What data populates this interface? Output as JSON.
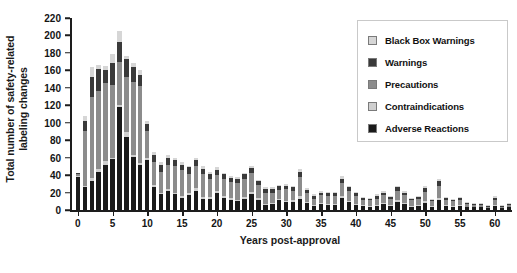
{
  "chart_data": {
    "type": "bar",
    "subtype": "stacked-bar",
    "title": "",
    "xlabel": "Years post-approval",
    "ylabel": "Total number of safety-related labeling changes",
    "xlim": [
      -0.8,
      62.5
    ],
    "ylim": [
      0,
      220
    ],
    "ytick_step": 20,
    "grid": false,
    "legend_position": "top-right",
    "yticks": [
      0,
      20,
      40,
      60,
      80,
      100,
      120,
      140,
      160,
      180,
      200,
      220
    ],
    "ytick_labels": [
      "0",
      "20",
      "40",
      "60",
      "80",
      "100",
      "120",
      "140",
      "160",
      "180",
      "200",
      "220"
    ],
    "xticks": [
      0,
      5,
      10,
      15,
      20,
      25,
      30,
      35,
      40,
      45,
      50,
      55,
      60
    ],
    "xtick_labels": [
      "0",
      "5",
      "10",
      "15",
      "20",
      "25",
      "30",
      "35",
      "40",
      "45",
      "50",
      "55",
      "60"
    ],
    "colors": {
      "black_box_warnings": "#d6d6d6",
      "warnings": "#3a3a3a",
      "precautions": "#8c8c8c",
      "contraindications": "#cfcfcf",
      "adverse_reactions": "#1a1a1a"
    },
    "series": [
      {
        "name": "Adverse Reactions",
        "color": "#1a1a1a",
        "values": [
          38,
          26,
          33,
          43,
          52,
          58,
          118,
          84,
          61,
          52,
          57,
          26,
          18,
          22,
          18,
          14,
          17,
          22,
          13,
          13,
          20,
          14,
          12,
          10,
          13,
          18,
          12,
          6,
          7,
          11,
          9,
          9,
          13,
          8,
          5,
          7,
          6,
          6,
          14,
          9,
          6,
          5,
          4,
          5,
          7,
          5,
          9,
          7,
          4,
          5,
          8,
          4,
          12,
          5,
          4,
          5,
          3,
          3,
          3,
          2,
          5,
          2,
          3
        ]
      },
      {
        "name": "Contraindications",
        "color": "#cfcfcf",
        "values": [
          1,
          1,
          4,
          4,
          4,
          2,
          2,
          5,
          2,
          2,
          3,
          3,
          2,
          2,
          2,
          2,
          2,
          3,
          2,
          2,
          2,
          2,
          2,
          1,
          2,
          3,
          2,
          1,
          1,
          2,
          1,
          2,
          3,
          1,
          1,
          1,
          1,
          1,
          2,
          1,
          1,
          1,
          1,
          1,
          1,
          1,
          2,
          1,
          1,
          1,
          2,
          1,
          2,
          1,
          1,
          1,
          0,
          0,
          0,
          0,
          1,
          0,
          0
        ]
      },
      {
        "name": "Precautions",
        "color": "#8c8c8c",
        "values": [
          2,
          64,
          93,
          89,
          89,
          83,
          50,
          64,
          84,
          88,
          30,
          26,
          24,
          28,
          30,
          30,
          22,
          25,
          26,
          21,
          18,
          20,
          18,
          20,
          21,
          21,
          15,
          13,
          12,
          10,
          14,
          11,
          22,
          10,
          7,
          9,
          9,
          9,
          15,
          12,
          9,
          6,
          6,
          7,
          9,
          7,
          11,
          9,
          6,
          7,
          11,
          5,
          14,
          6,
          5,
          6,
          4,
          3,
          3,
          2,
          6,
          2,
          3
        ]
      },
      {
        "name": "Warnings",
        "color": "#3a3a3a",
        "values": [
          1,
          11,
          23,
          26,
          16,
          25,
          22,
          20,
          17,
          13,
          9,
          8,
          8,
          8,
          7,
          6,
          8,
          7,
          6,
          5,
          6,
          5,
          5,
          5,
          5,
          6,
          4,
          4,
          4,
          4,
          4,
          4,
          6,
          4,
          3,
          3,
          3,
          3,
          5,
          4,
          3,
          2,
          2,
          3,
          3,
          2,
          4,
          3,
          2,
          2,
          4,
          2,
          5,
          2,
          2,
          2,
          1,
          1,
          1,
          1,
          2,
          1,
          1
        ]
      },
      {
        "name": "Black Box Warnings",
        "color": "#d6d6d6",
        "values": [
          0,
          6,
          11,
          4,
          4,
          11,
          13,
          4,
          4,
          5,
          3,
          3,
          3,
          3,
          3,
          3,
          2,
          3,
          3,
          3,
          3,
          2,
          2,
          2,
          2,
          3,
          2,
          2,
          2,
          2,
          2,
          2,
          3,
          2,
          2,
          2,
          2,
          2,
          3,
          2,
          2,
          1,
          1,
          2,
          2,
          1,
          2,
          2,
          1,
          1,
          2,
          1,
          3,
          1,
          1,
          1,
          1,
          1,
          1,
          1,
          2,
          1,
          1
        ]
      }
    ],
    "x": [
      0,
      1,
      2,
      3,
      4,
      5,
      6,
      7,
      8,
      9,
      10,
      11,
      12,
      13,
      14,
      15,
      16,
      17,
      18,
      19,
      20,
      21,
      22,
      23,
      24,
      25,
      26,
      27,
      28,
      29,
      30,
      31,
      32,
      33,
      34,
      35,
      36,
      37,
      38,
      39,
      40,
      41,
      42,
      43,
      44,
      45,
      46,
      47,
      48,
      49,
      50,
      51,
      52,
      53,
      54,
      55,
      56,
      57,
      58,
      59,
      60,
      61,
      62
    ],
    "totals": [
      42,
      108,
      164,
      166,
      165,
      179,
      205,
      177,
      168,
      160,
      102,
      66,
      55,
      63,
      60,
      55,
      51,
      60,
      50,
      44,
      49,
      43,
      39,
      38,
      43,
      51,
      35,
      26,
      26,
      29,
      30,
      28,
      47,
      25,
      18,
      22,
      21,
      21,
      39,
      28,
      21,
      15,
      14,
      18,
      22,
      16,
      28,
      22,
      14,
      16,
      27,
      13,
      36,
      15,
      13,
      15,
      9,
      8,
      8,
      6,
      16,
      6,
      8
    ]
  },
  "legend": {
    "items": [
      {
        "label": "Black Box Warnings",
        "color": "#d6d6d6",
        "name": "black-box-warnings"
      },
      {
        "label": "Warnings",
        "color": "#3a3a3a",
        "name": "warnings"
      },
      {
        "label": "Precautions",
        "color": "#8c8c8c",
        "name": "precautions"
      },
      {
        "label": "Contraindications",
        "color": "#cfcfcf",
        "name": "contraindications"
      },
      {
        "label": "Adverse Reactions",
        "color": "#1a1a1a",
        "name": "adverse-reactions"
      }
    ]
  },
  "axes": {
    "y_title_line1": "Total number of safety-related",
    "y_title_line2": "labeling changes",
    "x_title": "Years post-approval"
  }
}
